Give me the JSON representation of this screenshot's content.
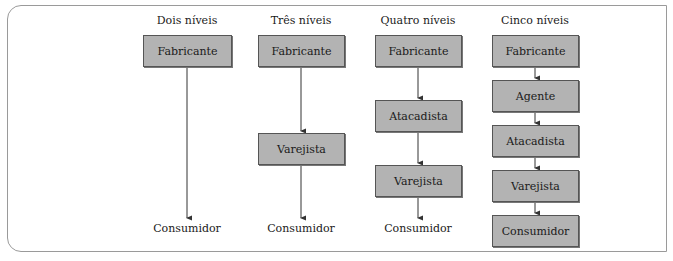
{
  "diagram": {
    "columns": [
      {
        "title": "Dois níveis",
        "nodes": [
          {
            "label": "Fabricante",
            "boxed": true
          },
          {
            "label": "Consumidor",
            "boxed": false
          }
        ]
      },
      {
        "title": "Três níveis",
        "nodes": [
          {
            "label": "Fabricante",
            "boxed": true
          },
          {
            "label": "Varejista",
            "boxed": true
          },
          {
            "label": "Consumidor",
            "boxed": false
          }
        ]
      },
      {
        "title": "Quatro níveis",
        "nodes": [
          {
            "label": "Fabricante",
            "boxed": true
          },
          {
            "label": "Atacadista",
            "boxed": true
          },
          {
            "label": "Varejista",
            "boxed": true
          },
          {
            "label": "Consumidor",
            "boxed": false
          }
        ]
      },
      {
        "title": "Cinco níveis",
        "nodes": [
          {
            "label": "Fabricante",
            "boxed": true
          },
          {
            "label": "Agente",
            "boxed": true
          },
          {
            "label": "Atacadista",
            "boxed": true
          },
          {
            "label": "Varejista",
            "boxed": true
          },
          {
            "label": "Consumidor",
            "boxed": true
          }
        ]
      }
    ],
    "colors": {
      "box_fill": "#b3b3b3",
      "box_border": "#555555",
      "frame_border": "#9a9a9a",
      "arrow": "#333333"
    }
  }
}
